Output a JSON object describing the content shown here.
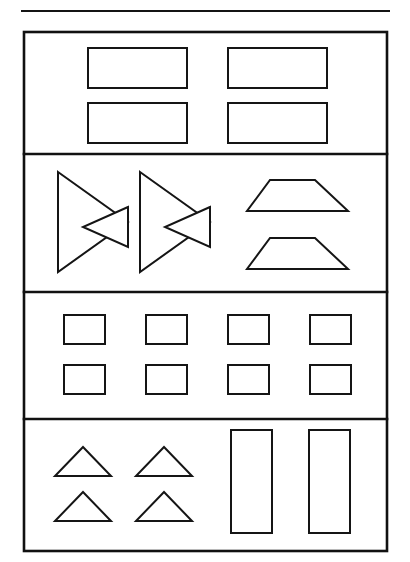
{
  "page": {
    "width": 410,
    "height": 562,
    "background": "#ffffff",
    "ink_color": "#151515"
  },
  "header_rule": {
    "name": "top-horizontal-rule",
    "x1": 21,
    "y1": 11,
    "x2": 390,
    "y2": 11,
    "stroke_width": 2
  },
  "frame": {
    "name": "worksheet-outer-frame",
    "x": 24,
    "y": 32,
    "width": 363,
    "height": 519,
    "stroke_width": 2.6
  },
  "dividers": [
    {
      "name": "row-divider-1",
      "y": 154,
      "x1": 24,
      "x2": 387,
      "stroke_width": 2.6
    },
    {
      "name": "row-divider-2",
      "y": 292,
      "x1": 24,
      "x2": 387,
      "stroke_width": 2.6
    },
    {
      "name": "row-divider-3",
      "y": 419,
      "x1": 24,
      "x2": 387,
      "stroke_width": 2.6
    }
  ],
  "rows": [
    {
      "name": "row-1-wide-rectangles",
      "index": 1,
      "label": "Row 1: four wide rectangles",
      "band": {
        "top": 32,
        "bottom": 154
      },
      "shape_count": 4,
      "shapes": [
        {
          "name": "wide-rectangle",
          "type": "rect",
          "x": 88,
          "y": 48,
          "width": 99,
          "height": 40,
          "stroke_width": 2
        },
        {
          "name": "wide-rectangle",
          "type": "rect",
          "x": 228,
          "y": 48,
          "width": 99,
          "height": 40,
          "stroke_width": 2
        },
        {
          "name": "wide-rectangle",
          "type": "rect",
          "x": 88,
          "y": 103,
          "width": 99,
          "height": 40,
          "stroke_width": 2
        },
        {
          "name": "wide-rectangle",
          "type": "rect",
          "x": 228,
          "y": 103,
          "width": 99,
          "height": 40,
          "stroke_width": 2
        }
      ]
    },
    {
      "name": "row-2-bowties-and-trapezoids",
      "index": 2,
      "label": "Row 2: two bowtie figures and two trapezoids",
      "band": {
        "top": 154,
        "bottom": 292
      },
      "shape_count": 4,
      "shapes": [
        {
          "name": "bowtie-large-triangle",
          "type": "polygon",
          "points": "58,172 128,222 58,272",
          "stroke_width": 2
        },
        {
          "name": "bowtie-small-triangle",
          "type": "polygon",
          "points": "128,207 83,227 128,247",
          "stroke_width": 2
        },
        {
          "name": "bowtie-large-triangle",
          "type": "polygon",
          "points": "140,172 210,222 140,272",
          "stroke_width": 2
        },
        {
          "name": "bowtie-small-triangle",
          "type": "polygon",
          "points": "210,207 165,227 210,247",
          "stroke_width": 2
        },
        {
          "name": "trapezoid",
          "type": "polygon",
          "points": "270,180 315,180 348,211 247,211",
          "stroke_width": 2
        },
        {
          "name": "trapezoid",
          "type": "polygon",
          "points": "270,238 315,238 348,269 247,269",
          "stroke_width": 2
        }
      ]
    },
    {
      "name": "row-3-small-rectangles",
      "index": 3,
      "label": "Row 3: eight small rectangles",
      "band": {
        "top": 292,
        "bottom": 419
      },
      "shape_count": 8,
      "shapes": [
        {
          "name": "small-rectangle",
          "type": "rect",
          "x": 64,
          "y": 315,
          "width": 41,
          "height": 29,
          "stroke_width": 2
        },
        {
          "name": "small-rectangle",
          "type": "rect",
          "x": 146,
          "y": 315,
          "width": 41,
          "height": 29,
          "stroke_width": 2
        },
        {
          "name": "small-rectangle",
          "type": "rect",
          "x": 228,
          "y": 315,
          "width": 41,
          "height": 29,
          "stroke_width": 2
        },
        {
          "name": "small-rectangle",
          "type": "rect",
          "x": 310,
          "y": 315,
          "width": 41,
          "height": 29,
          "stroke_width": 2
        },
        {
          "name": "small-rectangle",
          "type": "rect",
          "x": 64,
          "y": 365,
          "width": 41,
          "height": 29,
          "stroke_width": 2
        },
        {
          "name": "small-rectangle",
          "type": "rect",
          "x": 146,
          "y": 365,
          "width": 41,
          "height": 29,
          "stroke_width": 2
        },
        {
          "name": "small-rectangle",
          "type": "rect",
          "x": 228,
          "y": 365,
          "width": 41,
          "height": 29,
          "stroke_width": 2
        },
        {
          "name": "small-rectangle",
          "type": "rect",
          "x": 310,
          "y": 365,
          "width": 41,
          "height": 29,
          "stroke_width": 2
        }
      ]
    },
    {
      "name": "row-4-triangles-and-tall-rectangles",
      "index": 4,
      "label": "Row 4: four triangles and two tall rectangles",
      "band": {
        "top": 419,
        "bottom": 551
      },
      "shape_count": 6,
      "shapes": [
        {
          "name": "triangle",
          "type": "polygon",
          "points": "83,447 111,476 55,476",
          "stroke_width": 2
        },
        {
          "name": "triangle",
          "type": "polygon",
          "points": "164,447 192,476 136,476",
          "stroke_width": 2
        },
        {
          "name": "triangle",
          "type": "polygon",
          "points": "83,492 111,521 55,521",
          "stroke_width": 2
        },
        {
          "name": "triangle",
          "type": "polygon",
          "points": "164,492 192,521 136,521",
          "stroke_width": 2
        },
        {
          "name": "tall-rectangle",
          "type": "rect",
          "x": 231,
          "y": 430,
          "width": 41,
          "height": 103,
          "stroke_width": 2
        },
        {
          "name": "tall-rectangle",
          "type": "rect",
          "x": 309,
          "y": 430,
          "width": 41,
          "height": 103,
          "stroke_width": 2
        }
      ]
    }
  ],
  "summary": {
    "total_rows": 4,
    "total_shapes": 22,
    "shape_kinds": [
      "rectangle",
      "triangle",
      "trapezoid",
      "bowtie"
    ]
  }
}
